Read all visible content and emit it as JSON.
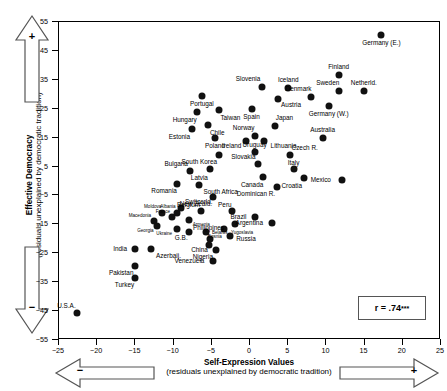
{
  "chart_data": {
    "type": "scatter",
    "title": "",
    "xlabel": "Self-Expression Values",
    "xlabel_sub": "(residuals unexplained by democratic tradition)",
    "ylabel": "Effective Democracy",
    "ylabel_sub": "(residuals unexplained by democratic tradition)",
    "xlim": [
      -25,
      25
    ],
    "ylim": [
      -55,
      55
    ],
    "xticks": [
      -25,
      -20,
      -15,
      -10,
      -5,
      0,
      5,
      10,
      15,
      20,
      25
    ],
    "yticks": [
      55,
      45,
      35,
      25,
      15,
      5,
      -5,
      -15,
      -25,
      -35,
      -45,
      -55
    ],
    "grid": false,
    "legend": "none",
    "annotations": {
      "correlation": "r = .74",
      "significance": "***",
      "x_axis_left_sign": "−",
      "x_axis_right_sign": "+",
      "y_axis_top_sign": "+",
      "y_axis_bottom_sign": "−"
    },
    "points": [
      {
        "label": "Germany (E.)",
        "x": 17.2,
        "y": 50.5,
        "lx": 0,
        "ly": 6
      },
      {
        "label": "Finland",
        "x": 11.6,
        "y": 36.5,
        "lx": 0,
        "ly": -6
      },
      {
        "label": "Netherld.",
        "x": 14.9,
        "y": 31.0,
        "lx": 0,
        "ly": -6
      },
      {
        "label": "Sweden",
        "x": 11.6,
        "y": 31.0,
        "lx": -1,
        "ly": -6
      },
      {
        "label": "Iceland",
        "x": 5.0,
        "y": 32.0,
        "lx": 0,
        "ly": -6
      },
      {
        "label": "Denmark",
        "x": 8.0,
        "y": 29.0,
        "lx": -1,
        "ly": -6
      },
      {
        "label": "Germany (W.)",
        "x": 10.3,
        "y": 26.0,
        "lx": 0,
        "ly": 6
      },
      {
        "label": "Slovenia",
        "x": 1.6,
        "y": 32.5,
        "lx": -1,
        "ly": -6
      },
      {
        "label": "Austria",
        "x": 3.6,
        "y": 28.5,
        "lx": 2,
        "ly": 5
      },
      {
        "label": "Portugal",
        "x": -6.3,
        "y": 29.5,
        "lx": 0,
        "ly": 6
      },
      {
        "label": "Taiwan",
        "x": -4.0,
        "y": 24.5,
        "lx": 1,
        "ly": 6
      },
      {
        "label": "Hungary",
        "x": -6.9,
        "y": 24.0,
        "lx": -1,
        "ly": 6
      },
      {
        "label": "Spain",
        "x": 0.2,
        "y": 25.0,
        "lx": 0,
        "ly": 6
      },
      {
        "label": "Chile",
        "x": -5.5,
        "y": 19.5,
        "lx": 1,
        "ly": 6
      },
      {
        "label": "Estonia",
        "x": -7.6,
        "y": 18.0,
        "lx": -1,
        "ly": 6
      },
      {
        "label": "Poland",
        "x": -4.6,
        "y": 15.0,
        "lx": 0,
        "ly": 6
      },
      {
        "label": "Japan",
        "x": 3.3,
        "y": 19.0,
        "lx": 1,
        "ly": -6
      },
      {
        "label": "Norway",
        "x": 0.6,
        "y": 15.5,
        "lx": -1,
        "ly": -6
      },
      {
        "label": "Ireland",
        "x": -0.5,
        "y": 14.0,
        "lx": -3,
        "ly": 4
      },
      {
        "label": "Lithuania",
        "x": 1.8,
        "y": 14.0,
        "lx": 5,
        "ly": 4
      },
      {
        "label": "Australia",
        "x": 9.5,
        "y": 15.0,
        "lx": 0,
        "ly": -6
      },
      {
        "label": "Uruguay",
        "x": 0.6,
        "y": 10.0,
        "lx": 0,
        "ly": -5
      },
      {
        "label": "Czech R.",
        "x": 5.3,
        "y": 9.0,
        "lx": 1,
        "ly": -5
      },
      {
        "label": "Slovakia",
        "x": 1.0,
        "y": 6.0,
        "lx": -1,
        "ly": -5
      },
      {
        "label": "South Korea",
        "x": -4.0,
        "y": 9.0,
        "lx": -2,
        "ly": 5
      },
      {
        "label": "Italy",
        "x": 5.7,
        "y": 4.0,
        "lx": 0,
        "ly": -5
      },
      {
        "label": "Canada",
        "x": 1.7,
        "y": 1.5,
        "lx": -1,
        "ly": 6
      },
      {
        "label": "Croatia",
        "x": 7.1,
        "y": 1.0,
        "lx": -1,
        "ly": 6
      },
      {
        "label": "Latvia",
        "x": -5.2,
        "y": 4.0,
        "lx": -1,
        "ly": 6
      },
      {
        "label": "Mexico",
        "x": 12.0,
        "y": 0.5,
        "lx": -11,
        "ly": 0
      },
      {
        "label": "Bulgaria",
        "x": -7.8,
        "y": 3.5,
        "lx": -1,
        "ly": -5
      },
      {
        "label": "Romania",
        "x": -9.6,
        "y": -1.0,
        "lx": -1,
        "ly": 5
      },
      {
        "label": "South Africa",
        "x": -6.7,
        "y": -1.5,
        "lx": 2,
        "ly": 5
      },
      {
        "label": "Dominican R.",
        "x": 3.5,
        "y": -2.0,
        "lx": -1,
        "ly": 5
      },
      {
        "label": "New Zeald.",
        "x": -4.8,
        "y": -5.5,
        "lx": -1,
        "ly": 5
      },
      {
        "label": "Switzerld.",
        "x": -9.0,
        "y": -9.5,
        "lx": 1,
        "ly": -5
      },
      {
        "label": "Belgium",
        "x": -6.4,
        "y": -10.5,
        "lx": -1,
        "ly": -5
      },
      {
        "label": "Peru",
        "x": -2.3,
        "y": -10.5,
        "lx": -1,
        "ly": -5
      },
      {
        "label": "Brazil",
        "x": 0.7,
        "y": -12.5,
        "lx": -7,
        "ly": 0
      },
      {
        "label": "Argentina",
        "x": 2.9,
        "y": -14.5,
        "lx": -8,
        "ly": 0
      },
      {
        "label": "Moldova",
        "x": -11.5,
        "y": -11.0,
        "lx": -1,
        "ly": -4,
        "tiny": true
      },
      {
        "label": "Albania",
        "x": -9.5,
        "y": -11.0,
        "lx": -1,
        "ly": -4,
        "tiny": true
      },
      {
        "label": "France",
        "x": -10.2,
        "y": -12.5,
        "lx": -2,
        "ly": -4,
        "tiny": true
      },
      {
        "label": "Armenia",
        "x": -8.0,
        "y": -13.5,
        "lx": 4,
        "ly": 4,
        "tiny": true
      },
      {
        "label": "Macedonia",
        "x": -12.6,
        "y": -14.0,
        "lx": -3,
        "ly": -4,
        "tiny": true
      },
      {
        "label": "Georgia",
        "x": -12.2,
        "y": -15.5,
        "lx": -3,
        "ly": 4,
        "tiny": true
      },
      {
        "label": "Ukraine",
        "x": -9.6,
        "y": -16.5,
        "lx": -4,
        "ly": 4,
        "tiny": true
      },
      {
        "label": "G.B.",
        "x": -8.0,
        "y": -17.5,
        "lx": -1,
        "ly": 5
      },
      {
        "label": "Bosnia",
        "x": -5.8,
        "y": -17.5,
        "lx": 2,
        "ly": 4,
        "tiny": true
      },
      {
        "label": "Yugoslavia",
        "x": -3.4,
        "y": -16.5,
        "lx": 6,
        "ly": 3,
        "tiny": true
      },
      {
        "label": "Philippines",
        "x": -2.0,
        "y": -15.0,
        "lx": -8,
        "ly": 3
      },
      {
        "label": "Russia",
        "x": -2.6,
        "y": -19.0,
        "lx": 6,
        "ly": 2
      },
      {
        "label": "Belarus",
        "x": -5.2,
        "y": -20.0,
        "lx": 1,
        "ly": -4,
        "tiny": true
      },
      {
        "label": "China",
        "x": -5.4,
        "y": -22.0,
        "lx": -1,
        "ly": 4
      },
      {
        "label": "Nigeria",
        "x": -4.4,
        "y": -24.0,
        "lx": -2,
        "ly": 5
      },
      {
        "label": "India",
        "x": -15.0,
        "y": -23.5,
        "lx": -7,
        "ly": 0
      },
      {
        "label": "Azerbaij.",
        "x": -13.0,
        "y": -23.5,
        "lx": 3,
        "ly": 5
      },
      {
        "label": "Pakistan",
        "x": -15.0,
        "y": -29.5,
        "lx": -1,
        "ly": 5
      },
      {
        "label": "Turkey",
        "x": -15.0,
        "y": -33.5,
        "lx": -1,
        "ly": 5
      },
      {
        "label": "Venezuela",
        "x": -4.8,
        "y": -27.5,
        "lx": -9,
        "ly": 0
      },
      {
        "label": "U.S.A.",
        "x": -22.6,
        "y": -45.5,
        "lx": -1,
        "ly": -5
      }
    ]
  }
}
